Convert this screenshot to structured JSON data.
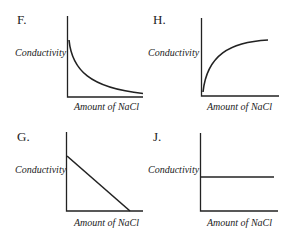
{
  "panels": [
    {
      "id": "F",
      "letter": "F.",
      "ylabel": "Conductivity",
      "xlabel": "Amount of NaCl",
      "shape": "decreasing exponential decay curve"
    },
    {
      "id": "H",
      "letter": "H.",
      "ylabel": "Conductivity",
      "xlabel": "Amount of NaCl",
      "shape": "increasing curve that levels off"
    },
    {
      "id": "G",
      "letter": "G.",
      "ylabel": "Conductivity",
      "xlabel": "Amount of NaCl",
      "shape": "straight line decreasing to zero"
    },
    {
      "id": "J",
      "letter": "J.",
      "ylabel": "Conductivity",
      "xlabel": "Amount of NaCl",
      "shape": "horizontal constant line"
    }
  ],
  "colors": {
    "line": "#222222",
    "axis": "#222222",
    "background": "#ffffff"
  }
}
